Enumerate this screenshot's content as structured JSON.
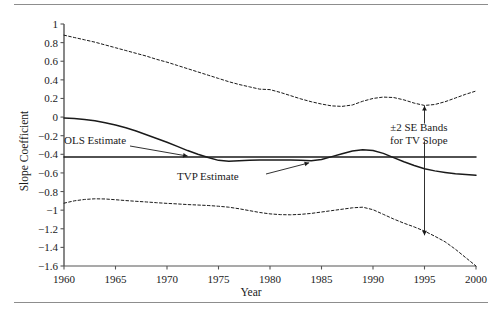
{
  "figure": {
    "has_top_rule": true,
    "has_bottom_rule": true
  },
  "labels": {
    "ylabel": "Slope Coefficient",
    "xlabel": "Year",
    "ols_annotation": "OLS Estimate",
    "tvp_annotation": "TVP Estimate",
    "se_annotation_line1": "±2 SE Bands",
    "se_annotation_line2": "for TV Slope"
  },
  "chart_data": {
    "type": "line",
    "title": "",
    "xlabel": "Year",
    "ylabel": "Slope Coefficient",
    "xlim": [
      1960,
      2000
    ],
    "ylim": [
      -1.6,
      1.0
    ],
    "xticks": [
      1960,
      1965,
      1970,
      1975,
      1980,
      1985,
      1990,
      1995,
      2000
    ],
    "xtick_labels": [
      "1960",
      "1965",
      "1970",
      "1975",
      "1980",
      "1985",
      "1990",
      "1995",
      "2000"
    ],
    "yticks": [
      1,
      0.8,
      0.6,
      0.4,
      0.2,
      0,
      -0.2,
      -0.4,
      -0.6,
      -0.8,
      -1,
      -1.2,
      -1.4,
      -1.6
    ],
    "ytick_labels": [
      "1",
      "0.8",
      "0.6",
      "0.4",
      "0.2",
      "0",
      "−0.2",
      "−0.4",
      "−0.6",
      "−0.8",
      "−1",
      "−1.2",
      "−1.4",
      "−1.6"
    ],
    "grid": false,
    "legend": "none",
    "x": [
      1960,
      1961,
      1962,
      1963,
      1964,
      1965,
      1966,
      1967,
      1968,
      1969,
      1970,
      1971,
      1972,
      1973,
      1974,
      1975,
      1976,
      1977,
      1978,
      1979,
      1980,
      1981,
      1982,
      1983,
      1984,
      1985,
      1986,
      1987,
      1988,
      1989,
      1990,
      1991,
      1992,
      1993,
      1994,
      1995,
      1996,
      1997,
      1998,
      1999,
      2000
    ],
    "series": [
      {
        "name": "OLS Estimate",
        "style": "solid-horizontal",
        "color": "#1a1a1a",
        "constant_value": -0.43,
        "values": [
          -0.43,
          -0.43,
          -0.43,
          -0.43,
          -0.43,
          -0.43,
          -0.43,
          -0.43,
          -0.43,
          -0.43,
          -0.43,
          -0.43,
          -0.43,
          -0.43,
          -0.43,
          -0.43,
          -0.43,
          -0.43,
          -0.43,
          -0.43,
          -0.43,
          -0.43,
          -0.43,
          -0.43,
          -0.43,
          -0.43,
          -0.43,
          -0.43,
          -0.43,
          -0.43,
          -0.43,
          -0.43,
          -0.43,
          -0.43,
          -0.43,
          -0.43,
          -0.43,
          -0.43,
          -0.43,
          -0.43,
          -0.43
        ]
      },
      {
        "name": "TVP Estimate",
        "style": "solid",
        "color": "#1a1a1a",
        "values": [
          -0.01,
          -0.015,
          -0.025,
          -0.04,
          -0.06,
          -0.085,
          -0.115,
          -0.15,
          -0.19,
          -0.23,
          -0.27,
          -0.315,
          -0.36,
          -0.4,
          -0.435,
          -0.465,
          -0.475,
          -0.47,
          -0.465,
          -0.462,
          -0.46,
          -0.46,
          -0.46,
          -0.465,
          -0.47,
          -0.455,
          -0.425,
          -0.395,
          -0.365,
          -0.35,
          -0.36,
          -0.39,
          -0.435,
          -0.48,
          -0.52,
          -0.555,
          -0.578,
          -0.595,
          -0.61,
          -0.618,
          -0.625
        ]
      },
      {
        "name": "Upper 2 SE Band",
        "style": "dashed",
        "color": "#1a1a1a",
        "values": [
          0.88,
          0.855,
          0.83,
          0.805,
          0.775,
          0.745,
          0.715,
          0.685,
          0.655,
          0.62,
          0.59,
          0.555,
          0.52,
          0.485,
          0.45,
          0.415,
          0.38,
          0.35,
          0.325,
          0.3,
          0.295,
          0.265,
          0.23,
          0.195,
          0.165,
          0.14,
          0.12,
          0.115,
          0.13,
          0.17,
          0.2,
          0.215,
          0.21,
          0.185,
          0.15,
          0.125,
          0.135,
          0.165,
          0.205,
          0.245,
          0.28
        ]
      },
      {
        "name": "Lower 2 SE Band",
        "style": "dashed",
        "color": "#1a1a1a",
        "values": [
          -0.925,
          -0.9,
          -0.885,
          -0.878,
          -0.88,
          -0.888,
          -0.897,
          -0.905,
          -0.912,
          -0.92,
          -0.927,
          -0.933,
          -0.94,
          -0.945,
          -0.95,
          -0.958,
          -0.968,
          -0.985,
          -1.005,
          -1.025,
          -1.04,
          -1.048,
          -1.05,
          -1.045,
          -1.035,
          -1.02,
          -1.005,
          -0.99,
          -0.975,
          -0.968,
          -0.995,
          -1.045,
          -1.095,
          -1.14,
          -1.18,
          -1.225,
          -1.28,
          -1.34,
          -1.42,
          -1.51,
          -1.6
        ]
      }
    ],
    "annotations": [
      {
        "text": "OLS Estimate",
        "x": 1962,
        "y": -0.2,
        "points_to": {
          "x": 1972,
          "y": -0.43
        }
      },
      {
        "text": "TVP Estimate",
        "x": 1971,
        "y": -0.62,
        "points_to": {
          "x": 1983.5,
          "y": -0.47
        }
      },
      {
        "text": "±2 SE Bands for TV Slope",
        "x": 1995,
        "y": -0.1,
        "points_to_up": {
          "x": 1995,
          "y": 0.13
        },
        "points_to_down": {
          "x": 1995,
          "y": -1.27
        }
      }
    ]
  }
}
